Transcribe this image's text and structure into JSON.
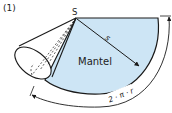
{
  "figure": {
    "label": "(1)",
    "apex_label": "S",
    "slant_label": "s",
    "region_label": "Mantel",
    "arc_length_label": "2 · π · r"
  },
  "colors": {
    "fill": "#cde5f5",
    "stroke": "#1a1a1a"
  }
}
